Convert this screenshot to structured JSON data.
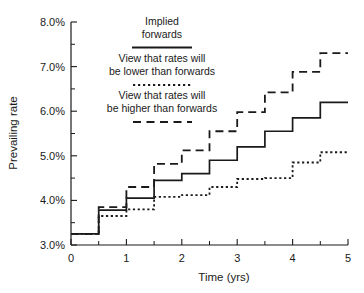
{
  "chart_data": {
    "type": "line",
    "subtype": "step-post",
    "title": "",
    "xlabel": "Time (yrs)",
    "ylabel": "Prevailing rate",
    "xlim": [
      0,
      5
    ],
    "ylim": [
      3.0,
      8.0
    ],
    "grid": false,
    "legend_position": "upper-left-inside",
    "x_ticks": [
      0,
      1,
      2,
      3,
      4,
      5
    ],
    "x_tick_labels": [
      "0",
      "1",
      "2",
      "3",
      "4",
      "5"
    ],
    "x_minor_ticks": [
      0.5,
      1.5,
      2.5,
      3.5,
      4.5
    ],
    "y_ticks": [
      3.0,
      4.0,
      5.0,
      6.0,
      7.0,
      8.0
    ],
    "y_tick_labels": [
      "3.0%",
      "4.0%",
      "5.0%",
      "6.0%",
      "7.0%",
      "8.0%"
    ],
    "y_minor_ticks": [
      3.5,
      4.5,
      5.5,
      6.5,
      7.5
    ],
    "step_edges": [
      0,
      0.5,
      1.0,
      1.5,
      2.0,
      2.5,
      3.0,
      3.5,
      4.0,
      4.5,
      5.0
    ],
    "series": [
      {
        "name": "Implied forwards",
        "style": "solid",
        "values": [
          3.25,
          3.78,
          4.05,
          4.45,
          4.6,
          4.9,
          5.2,
          5.55,
          5.85,
          6.2
        ]
      },
      {
        "name": "View that rates will be lower than forwards",
        "style": "dotted",
        "values": [
          3.25,
          3.65,
          3.8,
          4.08,
          4.12,
          4.3,
          4.48,
          4.5,
          4.85,
          5.08
        ]
      },
      {
        "name": "View that rates will be higher than forwards",
        "style": "dashed",
        "values": [
          3.25,
          3.85,
          4.3,
          4.82,
          5.12,
          5.55,
          5.98,
          6.42,
          6.88,
          7.3
        ]
      }
    ]
  },
  "legend": {
    "entries": [
      {
        "line1": "Implied",
        "line2": "forwards",
        "style": "solid"
      },
      {
        "line1": "View that rates will",
        "line2": "be lower than forwards",
        "style": "dotted"
      },
      {
        "line1": "View that rates will",
        "line2": "be higher than forwards",
        "style": "dashed"
      }
    ]
  }
}
